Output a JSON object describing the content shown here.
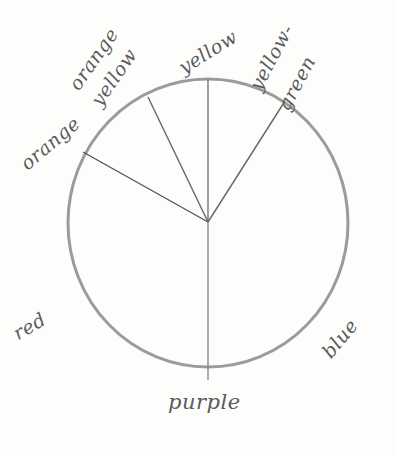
{
  "diagram": {
    "type": "color-wheel-sketch",
    "labels": {
      "yellow": "yellow",
      "orange_yellow_line1": "orange",
      "orange_yellow_line2": "yellow",
      "yellow_green_line1": "yellow-",
      "yellow_green_line2": "green",
      "orange": "orange",
      "red": "red",
      "blue": "blue",
      "purple": "purple"
    },
    "colors": {
      "pencil": "#6e6e6e",
      "paper": "#fdfdfc"
    }
  }
}
